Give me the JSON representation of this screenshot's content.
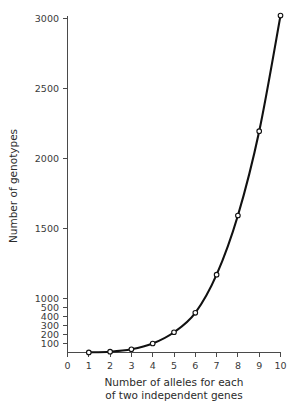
{
  "chart_data": {
    "type": "line",
    "title": "",
    "xlabel": "Number of alleles for each of two independent genes",
    "ylabel": "Number of genotypes",
    "x": [
      1,
      2,
      3,
      4,
      5,
      6,
      7,
      8,
      9,
      10
    ],
    "values": [
      1,
      9,
      36,
      100,
      225,
      441,
      784,
      1296,
      2025,
      3025
    ],
    "series": [
      {
        "name": "Number of genotypes",
        "values": [
          1,
          9,
          36,
          100,
          225,
          441,
          784,
          1296,
          2025,
          3025
        ]
      }
    ],
    "xlim": [
      0,
      10
    ],
    "ylim": [
      0,
      3000
    ],
    "xticks": [
      0,
      1,
      2,
      3,
      4,
      5,
      6,
      7,
      8,
      9,
      10
    ],
    "yticks": [
      100,
      200,
      300,
      400,
      500,
      1000,
      1500,
      2000,
      2500,
      3000
    ],
    "grid": false,
    "legend": false,
    "marker": "open-circle",
    "y_axis_note": "broken axis: 0-500 compressed, 500-3000 linear"
  },
  "axes": {
    "y_title": "Number of genotypes",
    "x_title_line1": "Number of alleles for each",
    "x_title_line2": "of two independent genes",
    "x_tick_labels": [
      "0",
      "1",
      "2",
      "3",
      "4",
      "5",
      "6",
      "7",
      "8",
      "9",
      "10"
    ],
    "y_tick_labels": [
      "3000",
      "2500",
      "2000",
      "1500",
      "1000",
      "500",
      "400",
      "300",
      "200",
      "100"
    ]
  },
  "colors": {
    "curve": "#111111",
    "marker_fill": "#ffffff",
    "axis": "#4a4a4a",
    "text": "#2b2b2b",
    "background": "#ffffff"
  }
}
